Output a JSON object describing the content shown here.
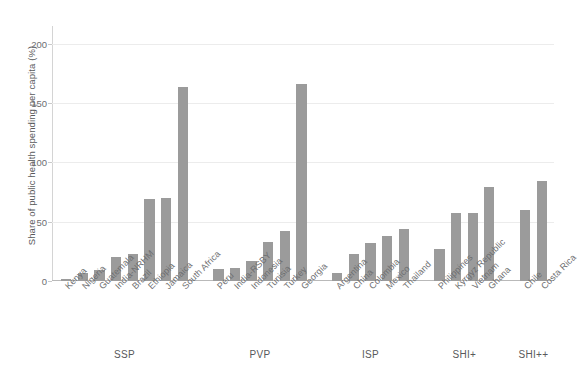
{
  "chart_data": {
    "type": "bar",
    "title": "",
    "xlabel": "",
    "ylabel": "Share of public health spending per capita (%)",
    "ylim": [
      0,
      215
    ],
    "yticks": [
      0,
      50,
      100,
      150,
      200
    ],
    "grid": true,
    "legend": null,
    "bar_color": "#9b9b9b",
    "categories": [
      "Kenya",
      "Nigeria",
      "Guatemala",
      "India-NRHM",
      "Brazil",
      "Ethiopia",
      "Jamaica",
      "South Africa",
      "Peru",
      "India-RSBY",
      "Indonesia",
      "Tunisia",
      "Turkey",
      "Georgia",
      "Argentina",
      "China",
      "Colombia",
      "Mexico",
      "Thailand",
      "Philippines",
      "Kyrgyz Republic",
      "Vietnam",
      "Ghana",
      "Chile",
      "Costa Rica"
    ],
    "values": [
      2,
      7,
      9,
      20,
      23,
      69,
      70,
      164,
      10,
      11,
      17,
      33,
      42,
      166,
      7,
      23,
      32,
      38,
      44,
      27,
      57,
      57,
      79,
      60,
      84
    ],
    "groups": [
      {
        "label": "SSP",
        "start": 0,
        "count": 8
      },
      {
        "label": "PVP",
        "start": 8,
        "count": 6
      },
      {
        "label": "ISP",
        "start": 14,
        "count": 5
      },
      {
        "label": "SHI+",
        "start": 19,
        "count": 4
      },
      {
        "label": "SHI++",
        "start": 23,
        "count": 2
      }
    ]
  }
}
